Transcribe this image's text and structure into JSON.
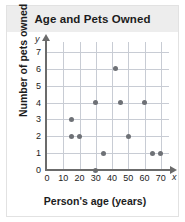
{
  "chart_data": {
    "type": "scatter",
    "title": "Age and Pets Owned",
    "xlabel": "Person's age (years)",
    "ylabel": "Number of pets owned",
    "x_var": "x",
    "y_var": "y",
    "xlim": [
      0,
      75
    ],
    "ylim": [
      0,
      7.6
    ],
    "xticks": [
      0,
      10,
      20,
      30,
      40,
      50,
      60,
      70
    ],
    "yticks": [
      0,
      1,
      2,
      3,
      4,
      5,
      6,
      7
    ],
    "grid": true,
    "legend": "none",
    "point_color": "#6e7176",
    "grid_color": "#c8ccd4",
    "axis_color": "#6b6b6b",
    "points": [
      {
        "x": 15,
        "y": 3
      },
      {
        "x": 15,
        "y": 2
      },
      {
        "x": 20,
        "y": 2
      },
      {
        "x": 30,
        "y": 4
      },
      {
        "x": 30,
        "y": 0
      },
      {
        "x": 35,
        "y": 1
      },
      {
        "x": 42,
        "y": 6
      },
      {
        "x": 45,
        "y": 4
      },
      {
        "x": 50,
        "y": 2
      },
      {
        "x": 60,
        "y": 4
      },
      {
        "x": 65,
        "y": 1
      },
      {
        "x": 70,
        "y": 1
      }
    ]
  }
}
